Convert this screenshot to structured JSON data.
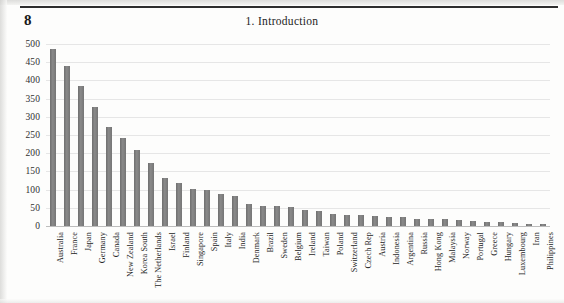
{
  "page": {
    "number": "8",
    "running_head": "1. Introduction"
  },
  "chart_data": {
    "type": "bar",
    "title": "",
    "xlabel": "",
    "ylabel": "",
    "ylim": [
      0,
      500
    ],
    "ytick_step": 50,
    "yticks": [
      "500",
      "450",
      "400",
      "350",
      "300",
      "250",
      "200",
      "150",
      "100",
      "50",
      "0"
    ],
    "grid": true,
    "legend": "none",
    "bar_color": "#7b7b7b",
    "categories": [
      "Australia",
      "France",
      "Japan",
      "Germany",
      "Canada",
      "New Zealand",
      "Korea South",
      "The Netherlands",
      "Israel",
      "Finland",
      "Singapore",
      "Spain",
      "Italy",
      "India",
      "Denmark",
      "Brazil",
      "Sweden",
      "Belgium",
      "Ireland",
      "Taiwan",
      "Poland",
      "Switzerland",
      "Czech Rep",
      "Austria",
      "Indonesia",
      "Argentina",
      "Russia",
      "Hong Kong",
      "Malaysia",
      "Norway",
      "Portugal",
      "Greece",
      "Hungary",
      "Luxembourg",
      "Iran",
      "Philippines"
    ],
    "values": [
      485,
      440,
      385,
      327,
      272,
      243,
      208,
      172,
      133,
      118,
      101,
      100,
      88,
      82,
      60,
      56,
      54,
      52,
      43,
      40,
      32,
      30,
      29,
      28,
      26,
      24,
      20,
      19,
      18,
      16,
      14,
      12,
      10,
      8,
      6,
      5
    ]
  }
}
